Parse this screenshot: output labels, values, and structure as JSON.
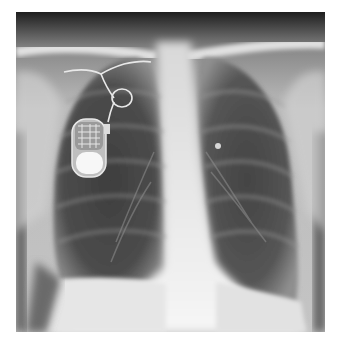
{
  "image": {
    "subject": "chest X-ray (PA view) with implanted pacemaker",
    "alt": "Frontal chest radiograph showing a pacemaker generator in the right upper chest with a lead looping into the heart"
  },
  "colors": {
    "background": "#ffffff",
    "lung": "#4a4a4a",
    "soft_tissue": "#c8c8c8",
    "bone": "#e8e8e8",
    "device": "#f4f4f4",
    "top_edge": "#2a2a2a"
  }
}
